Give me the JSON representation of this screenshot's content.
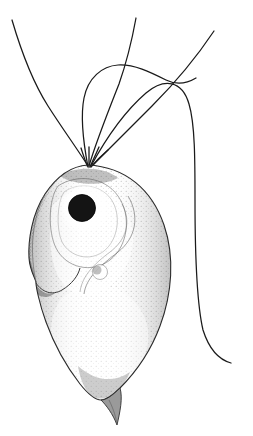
{
  "figure": {
    "kind": "scientific-line-illustration",
    "caption": "",
    "background_color": "#ffffff",
    "ink_color": "#1a1a1a",
    "canvas": {
      "width": 253,
      "height": 436
    }
  },
  "palette": {
    "background": "#ffffff",
    "outline": "#2b2b2b",
    "flagella": "#1a1a1a",
    "nucleus": "#121212",
    "stipple_dark": "#4a4a4a",
    "stipple_mid": "#7d7d7d",
    "stipple_light": "#b9b9b9",
    "body_fill": "#f2f2f2"
  },
  "structures": {
    "cell_body": {
      "label": "cell body",
      "description": "ovoid stippled cell body, broad at the anterior, tapering posteriorly",
      "bounds": {
        "x": 28,
        "y": 163,
        "width": 142,
        "height": 215
      }
    },
    "nucleus": {
      "label": "nucleus",
      "description": "solid dark round nucleus in anterior third",
      "center": {
        "x": 82,
        "y": 208
      },
      "radius": 13,
      "color": "#121212"
    },
    "nucleus_halo": {
      "label": "perinuclear halo",
      "description": "pale unstippled ring around the nucleus",
      "center": {
        "x": 85,
        "y": 208
      },
      "radius": 27
    },
    "contractile_vacuole": {
      "label": "contractile vacuole",
      "description": "small faint circular vacuole mid-body",
      "center": {
        "x": 100,
        "y": 272
      },
      "radius": 7
    },
    "gullet_notch": {
      "label": "lateral notch / gullet",
      "description": "indentation on the left margin about two thirds down",
      "position": {
        "x": 36,
        "y": 290
      }
    },
    "tail_spine": {
      "label": "caudal spine",
      "description": "slender pointed tail spine extending from the posterior end",
      "tip": {
        "x": 117,
        "y": 425
      }
    },
    "flagella_base": {
      "label": "flagellar insertion point",
      "description": "apical point where all flagella emerge",
      "position": {
        "x": 88,
        "y": 166
      }
    }
  },
  "flagella": [
    {
      "id": "flagellum-1",
      "label": "left flagellum",
      "description": "sweeps far to the upper left, ending near the top-left corner",
      "end": {
        "x": 12,
        "y": 20
      },
      "stroke_width": 1.3
    },
    {
      "id": "flagellum-2",
      "label": "hooked flagellum",
      "description": "arches upward then bends sharply to the right, crossing the others",
      "end": {
        "x": 196,
        "y": 78
      },
      "stroke_width": 1.3
    },
    {
      "id": "flagellum-3",
      "label": "central flagellum",
      "description": "rises almost vertically from the apex to the top edge",
      "end": {
        "x": 136,
        "y": 18
      },
      "stroke_width": 1.3
    },
    {
      "id": "flagellum-4",
      "label": "long trailing flagellum",
      "description": "arcs over the top right, descends the right side and curves out at the bottom",
      "end": {
        "x": 231,
        "y": 363
      },
      "stroke_width": 1.3
    },
    {
      "id": "flagellum-5",
      "label": "short right flagellum",
      "description": "short stroke angled to the upper right, ending at the top-right",
      "end": {
        "x": 214,
        "y": 31
      },
      "stroke_width": 1.3
    }
  ]
}
